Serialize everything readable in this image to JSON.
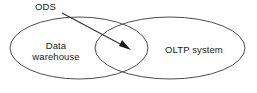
{
  "diagram": {
    "type": "venn-two-set",
    "title_label": "ODS",
    "left_set": {
      "name": "data-warehouse",
      "label_line1": "Data",
      "label_line2": "warehouse"
    },
    "right_set": {
      "name": "oltp-system",
      "label": "OLTP system"
    },
    "annotation": {
      "label": "ODS",
      "points_to": "intersection",
      "arrow_style": "filled-triangle"
    },
    "colors": {
      "background": "#ffffff",
      "ellipse_stroke": "#4d4d4d",
      "text": "#1a1a1a",
      "leader_stroke": "#333333",
      "arrow_fill": "#1a1a1a"
    },
    "geometry": {
      "left_ellipse": {
        "cx": 79,
        "cy": 48,
        "rx": 69,
        "ry": 31
      },
      "right_ellipse": {
        "cx": 170,
        "cy": 48,
        "rx": 75,
        "ry": 31
      },
      "leader_from": {
        "x": 62,
        "y": 13
      },
      "leader_to": {
        "x": 128,
        "y": 48
      }
    }
  }
}
